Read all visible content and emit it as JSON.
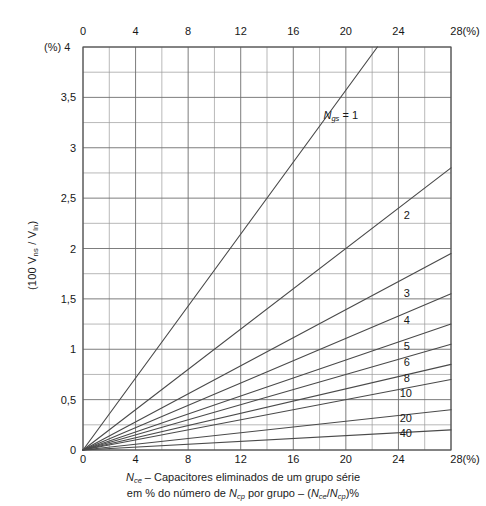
{
  "chart_data": {
    "type": "line",
    "title": "",
    "xlabel": "Nce - Capacitores eliminados de um grupo serie em % do numero de Ncp por grupo - (Nce/Ncp)%",
    "ylabel": "(100 Vns/Vln)",
    "xunit": "(%)",
    "yunit": "(%)",
    "xlim": [
      0,
      28
    ],
    "ylim": [
      0,
      4
    ],
    "grid": true,
    "x_major_step": 4,
    "x_minor_step": 2,
    "y_major_step": 0.5,
    "y_minor_step": 0.25,
    "xticks": [
      "0",
      "4",
      "8",
      "12",
      "16",
      "20",
      "24",
      "28"
    ],
    "xtick_values": [
      0,
      4,
      8,
      12,
      16,
      20,
      24,
      28
    ],
    "xtick_last_suffix": "28(%)",
    "yticks": [
      "0",
      "0,5",
      "1",
      "1,5",
      "2",
      "2,5",
      "3",
      "3,5",
      "4"
    ],
    "ytick_values": [
      0,
      0.5,
      1,
      1.5,
      2,
      2.5,
      3,
      3.5,
      4
    ],
    "legend_position": "inline-right-of-curves",
    "series_param_name": "Ngs",
    "series": [
      {
        "name": "1",
        "label": "Ngs = 1",
        "slope": 0.17857,
        "values": [
          [
            0,
            0
          ],
          [
            22.4,
            4.0
          ]
        ],
        "label_x": 18.3,
        "label_y": 3.32
      },
      {
        "name": "2",
        "label": "2",
        "slope": 0.1,
        "values": [
          [
            0,
            0
          ],
          [
            28,
            2.8
          ]
        ],
        "label_x": 24.4,
        "label_y": 2.32
      },
      {
        "name": "3",
        "label": "3",
        "slope": 0.0696,
        "values": [
          [
            0,
            0
          ],
          [
            28,
            1.95
          ]
        ],
        "label_x": 24.4,
        "label_y": 1.55
      },
      {
        "name": "4",
        "label": "4",
        "slope": 0.0554,
        "values": [
          [
            0,
            0
          ],
          [
            28,
            1.55
          ]
        ],
        "label_x": 24.4,
        "label_y": 1.28
      },
      {
        "name": "5",
        "label": "5",
        "slope": 0.0446,
        "values": [
          [
            0,
            0
          ],
          [
            28,
            1.25
          ]
        ],
        "label_x": 24.4,
        "label_y": 1.02
      },
      {
        "name": "6",
        "label": "6",
        "slope": 0.0375,
        "values": [
          [
            0,
            0
          ],
          [
            28,
            1.05
          ]
        ],
        "label_x": 24.4,
        "label_y": 0.86
      },
      {
        "name": "8",
        "label": "8",
        "slope": 0.0304,
        "values": [
          [
            0,
            0
          ],
          [
            28,
            0.85
          ]
        ],
        "label_x": 24.4,
        "label_y": 0.7
      },
      {
        "name": "10",
        "label": "10",
        "slope": 0.025,
        "values": [
          [
            0,
            0
          ],
          [
            28,
            0.7
          ]
        ],
        "label_x": 24.1,
        "label_y": 0.56
      },
      {
        "name": "20",
        "label": "20",
        "slope": 0.0143,
        "values": [
          [
            0,
            0
          ],
          [
            28,
            0.4
          ]
        ],
        "label_x": 24.1,
        "label_y": 0.31
      },
      {
        "name": "40",
        "label": "40",
        "slope": 0.0071,
        "values": [
          [
            0,
            0
          ],
          [
            28,
            0.2
          ]
        ],
        "label_x": 24.1,
        "label_y": 0.16
      }
    ]
  },
  "axes": {
    "y_title_prefix": "(100 V",
    "y_title_sub1": "ns",
    "y_title_mid": " / V",
    "y_title_sub2": "ln",
    "y_title_suffix": ")",
    "y_unit_corner": "(%) 4",
    "x_top_unit": "28(%)",
    "x_bottom_unit": "28(%)"
  },
  "caption": {
    "line1_sym": "N",
    "line1_sub": "ce",
    "line1_text": " – Capacitores eliminados de um grupo série",
    "line2_a": "em % do número de ",
    "line2_sym1": "N",
    "line2_sub1": "cp",
    "line2_b": " por grupo – (",
    "line2_sym2": "N",
    "line2_sub2": "ce",
    "line2_c": "/",
    "line2_sym3": "N",
    "line2_sub3": "cp",
    "line2_d": ")%"
  },
  "colors": {
    "curve": "#4a4a4a",
    "grid_minor": "#9a9a9a",
    "grid_major": "#6e6e6e",
    "frame": "#555555",
    "text": "#171717",
    "background": "#ffffff"
  }
}
